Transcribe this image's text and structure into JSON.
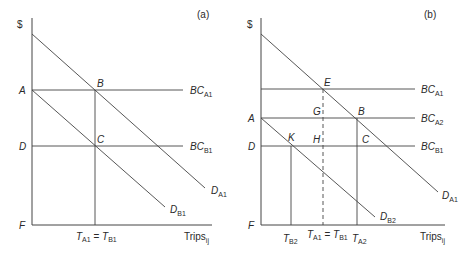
{
  "panels": [
    {
      "id": "a",
      "tag": "(a)",
      "y_axis_label": "$",
      "x_axis_label": "Trips",
      "x_axis_sub": "ij",
      "y_labels": {
        "A": "A",
        "D": "D",
        "F": "F"
      },
      "points": {
        "B": "B",
        "C": "C"
      },
      "lines": {
        "BC_A1": {
          "main": "BC",
          "sub": "A1"
        },
        "BC_B1": {
          "main": "BC",
          "sub": "B1"
        },
        "D_A1": {
          "main": "D",
          "sub": "A1"
        },
        "D_B1": {
          "main": "D",
          "sub": "B1"
        }
      },
      "x_tick": {
        "t1": "T",
        "s1": "A1",
        "eq": " = ",
        "t2": "T",
        "s2": "B1"
      }
    },
    {
      "id": "b",
      "tag": "(b)",
      "y_axis_label": "$",
      "x_axis_label": "Trips",
      "x_axis_sub": "ij",
      "y_labels": {
        "A": "A",
        "D": "D",
        "F": "F"
      },
      "points": {
        "E": "E",
        "G": "G",
        "B": "B",
        "K": "K",
        "H": "H",
        "C": "C"
      },
      "lines": {
        "BC_A1": {
          "main": "BC",
          "sub": "A1"
        },
        "BC_A2": {
          "main": "BC",
          "sub": "A2"
        },
        "BC_B1": {
          "main": "BC",
          "sub": "B1"
        },
        "D_A1": {
          "main": "D",
          "sub": "A1"
        },
        "D_B2": {
          "main": "D",
          "sub": "B2"
        }
      },
      "x_ticks": {
        "TB2": {
          "t": "T",
          "s": "B2"
        },
        "TA1TB1": {
          "t1": "T",
          "s1": "A1",
          "eq": " = ",
          "t2": "T",
          "s2": "B1"
        },
        "TA2": {
          "t": "T",
          "s": "A2"
        }
      }
    }
  ]
}
